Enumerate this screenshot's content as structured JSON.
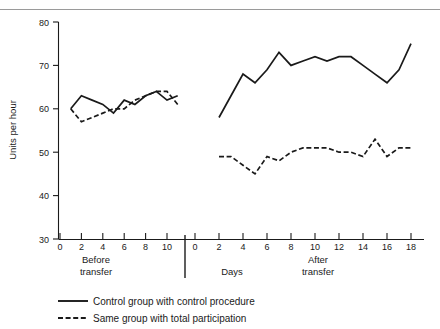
{
  "chart_data": {
    "type": "line",
    "title": "",
    "xlabel": "Days",
    "ylabel": "Units per hour",
    "ylim": [
      30,
      80
    ],
    "yticks": [
      30,
      40,
      50,
      60,
      70,
      80
    ],
    "grid": false,
    "legend_position": "bottom-left",
    "panels": [
      {
        "name": "Before transfer",
        "label": "Before transfer",
        "label_line1": "Before",
        "label_line2": "transfer",
        "xlim": [
          0,
          11
        ],
        "xticks": [
          0,
          2,
          4,
          6,
          8,
          10
        ],
        "x": [
          1,
          2,
          3,
          4,
          5,
          6,
          7,
          8,
          9,
          10,
          11
        ],
        "series": [
          {
            "name": "Control group with control procedure",
            "style": "solid",
            "values": [
              60,
              63,
              62,
              61,
              59,
              62,
              61,
              63,
              64,
              62,
              63
            ]
          },
          {
            "name": "Same group with total participation",
            "style": "dashed",
            "values": [
              60,
              57,
              58,
              59,
              60,
              60,
              62,
              63,
              64,
              64,
              61
            ]
          }
        ]
      },
      {
        "name": "After transfer",
        "label": "After transfer",
        "label_line1": "After",
        "label_line2": "transfer",
        "xlim": [
          0,
          19
        ],
        "xticks": [
          2,
          4,
          6,
          8,
          10,
          12,
          14,
          16,
          18
        ],
        "x": [
          2,
          3,
          4,
          5,
          6,
          7,
          8,
          9,
          10,
          11,
          12,
          13,
          14,
          15,
          16,
          17,
          18
        ],
        "series": [
          {
            "name": "Control group with control procedure",
            "style": "solid",
            "values": [
              58,
              63,
              68,
              66,
              69,
              73,
              70,
              71,
              72,
              71,
              72,
              72,
              70,
              68,
              66,
              69,
              75
            ]
          },
          {
            "name": "Same group with total participation",
            "style": "dashed",
            "values": [
              49,
              49,
              47,
              45,
              49,
              48,
              50,
              51,
              51,
              51,
              50,
              50,
              49,
              53,
              49,
              51,
              51
            ]
          }
        ]
      }
    ],
    "legend": [
      {
        "label": "Control group with control procedure",
        "style": "solid"
      },
      {
        "label": "Same group with total participation",
        "style": "dashed"
      }
    ]
  },
  "axis": {
    "y_title": "Units per hour",
    "x_title": "Days",
    "y_ticks": [
      "80",
      "70",
      "60",
      "50",
      "40",
      "30"
    ],
    "x_ticks_before": [
      "0",
      "2",
      "4",
      "6",
      "8",
      "10"
    ],
    "x_ticks_after": [
      "0",
      "2",
      "4",
      "6",
      "8",
      "10",
      "12",
      "14",
      "16",
      "18"
    ]
  },
  "labels": {
    "before_line1": "Before",
    "before_line2": "transfer",
    "after_line1": "After",
    "after_line2": "transfer",
    "days": "Days"
  },
  "legend": {
    "item1": "Control group with control procedure",
    "item2": "Same group with total participation"
  },
  "colors": {
    "ink": "#1a1a1a",
    "rule": "#9a9a9a",
    "background": "#ffffff"
  }
}
